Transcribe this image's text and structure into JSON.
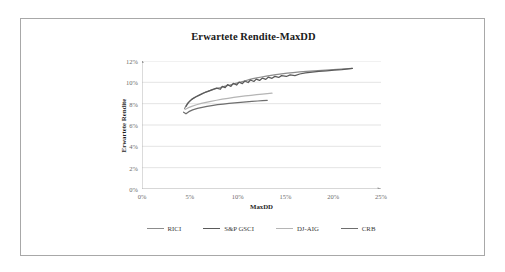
{
  "chart_data": {
    "type": "line",
    "title": "Erwartete Rendite-MaxDD",
    "xlabel": "MaxDD",
    "ylabel": "Erwartete Rendite",
    "xlim": [
      0,
      25
    ],
    "ylim": [
      0,
      12
    ],
    "x_ticks": [
      "0%",
      "5%",
      "10%",
      "15%",
      "20%",
      "25%"
    ],
    "x_tick_values": [
      0,
      5,
      10,
      15,
      20,
      25
    ],
    "y_ticks": [
      "0%",
      "2%",
      "4%",
      "6%",
      "8%",
      "10%",
      "12%"
    ],
    "y_tick_values": [
      0,
      2,
      4,
      6,
      8,
      10,
      12
    ],
    "grid": "horizontal",
    "legend_position": "bottom",
    "series": [
      {
        "name": "RICI",
        "color": "#8c8c8c",
        "points": [
          [
            4.45,
            7.55
          ],
          [
            4.7,
            7.95
          ],
          [
            5.0,
            8.25
          ],
          [
            5.35,
            8.5
          ],
          [
            5.75,
            8.7
          ],
          [
            6.2,
            8.9
          ],
          [
            6.7,
            9.1
          ],
          [
            7.2,
            9.25
          ],
          [
            7.7,
            9.4
          ],
          [
            8.2,
            9.5
          ],
          [
            8.7,
            9.65
          ],
          [
            9.2,
            9.75
          ],
          [
            9.6,
            9.85
          ],
          [
            10.0,
            9.95
          ],
          [
            10.4,
            10.05
          ],
          [
            10.8,
            10.15
          ],
          [
            11.2,
            10.25
          ],
          [
            11.6,
            10.35
          ],
          [
            12.0,
            10.42
          ],
          [
            12.5,
            10.5
          ],
          [
            13.0,
            10.58
          ],
          [
            13.5,
            10.65
          ],
          [
            14.0,
            10.72
          ],
          [
            14.6,
            10.8
          ],
          [
            15.2,
            10.86
          ],
          [
            15.8,
            10.92
          ],
          [
            16.5,
            10.98
          ],
          [
            17.2,
            11.03
          ],
          [
            18.0,
            11.08
          ],
          [
            18.8,
            11.13
          ],
          [
            19.6,
            11.18
          ],
          [
            20.4,
            11.22
          ],
          [
            21.2,
            11.27
          ],
          [
            22.0,
            11.3
          ]
        ]
      },
      {
        "name": "S&P GSCI",
        "color": "#5a5a5a",
        "points": [
          [
            4.6,
            7.75
          ],
          [
            4.85,
            8.1
          ],
          [
            5.2,
            8.4
          ],
          [
            5.6,
            8.62
          ],
          [
            6.0,
            8.8
          ],
          [
            6.45,
            9.0
          ],
          [
            6.9,
            9.15
          ],
          [
            7.35,
            9.32
          ],
          [
            7.8,
            9.45
          ],
          [
            8.2,
            9.35
          ],
          [
            8.4,
            9.62
          ],
          [
            8.7,
            9.5
          ],
          [
            8.95,
            9.78
          ],
          [
            9.3,
            9.62
          ],
          [
            9.55,
            9.9
          ],
          [
            9.9,
            9.75
          ],
          [
            10.15,
            10.02
          ],
          [
            10.5,
            9.88
          ],
          [
            10.75,
            10.12
          ],
          [
            11.1,
            9.98
          ],
          [
            11.35,
            10.22
          ],
          [
            11.7,
            10.08
          ],
          [
            11.95,
            10.3
          ],
          [
            12.3,
            10.18
          ],
          [
            12.6,
            10.4
          ],
          [
            12.95,
            10.28
          ],
          [
            13.2,
            10.48
          ],
          [
            13.6,
            10.38
          ],
          [
            13.9,
            10.56
          ],
          [
            14.3,
            10.46
          ],
          [
            14.6,
            10.63
          ],
          [
            15.1,
            10.55
          ],
          [
            15.5,
            10.7
          ],
          [
            16.0,
            10.63
          ],
          [
            16.5,
            10.78
          ],
          [
            17.1,
            10.88
          ],
          [
            17.8,
            10.95
          ],
          [
            18.5,
            11.02
          ],
          [
            19.3,
            11.08
          ],
          [
            20.1,
            11.15
          ],
          [
            20.9,
            11.2
          ],
          [
            21.6,
            11.26
          ],
          [
            22.0,
            11.3
          ]
        ]
      },
      {
        "name": "DJ-AIG",
        "color": "#b5b5b5",
        "points": [
          [
            4.5,
            7.45
          ],
          [
            4.8,
            7.6
          ],
          [
            5.2,
            7.75
          ],
          [
            5.7,
            7.9
          ],
          [
            6.2,
            8.02
          ],
          [
            6.7,
            8.12
          ],
          [
            7.2,
            8.22
          ],
          [
            7.8,
            8.32
          ],
          [
            8.4,
            8.42
          ],
          [
            9.0,
            8.5
          ],
          [
            9.6,
            8.58
          ],
          [
            10.2,
            8.65
          ],
          [
            10.8,
            8.72
          ],
          [
            11.4,
            8.78
          ],
          [
            12.0,
            8.84
          ],
          [
            12.6,
            8.9
          ],
          [
            13.1,
            8.94
          ],
          [
            13.6,
            8.98
          ]
        ]
      },
      {
        "name": "CRB",
        "color": "#6e6e6e",
        "points": [
          [
            4.35,
            7.2
          ],
          [
            4.6,
            7.05
          ],
          [
            4.9,
            7.25
          ],
          [
            5.3,
            7.42
          ],
          [
            5.8,
            7.55
          ],
          [
            6.3,
            7.65
          ],
          [
            6.8,
            7.75
          ],
          [
            7.3,
            7.82
          ],
          [
            7.9,
            7.9
          ],
          [
            8.5,
            7.96
          ],
          [
            9.1,
            8.02
          ],
          [
            9.7,
            8.08
          ],
          [
            10.3,
            8.12
          ],
          [
            10.9,
            8.17
          ],
          [
            11.5,
            8.21
          ],
          [
            12.1,
            8.25
          ],
          [
            12.6,
            8.28
          ],
          [
            13.1,
            8.31
          ]
        ]
      }
    ]
  },
  "legend": {
    "items": [
      {
        "label": "RICI",
        "color": "#8c8c8c"
      },
      {
        "label": "S&P GSCI",
        "color": "#5a5a5a"
      },
      {
        "label": "DJ-AIG",
        "color": "#b5b5b5"
      },
      {
        "label": "CRB",
        "color": "#6e6e6e"
      }
    ]
  }
}
